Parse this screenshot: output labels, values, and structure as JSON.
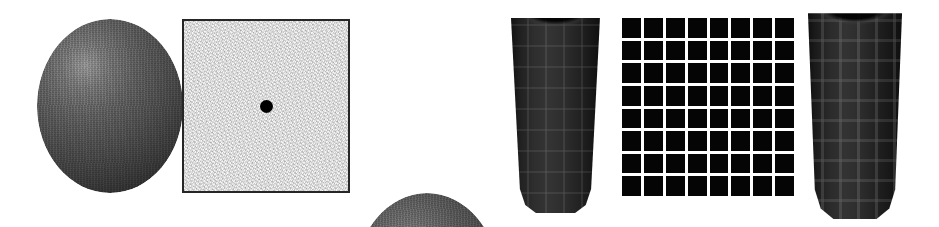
{
  "figure": {
    "width": 939,
    "height": 227,
    "background_color": "#ffffff",
    "panel_count": 6,
    "panel_order": [
      "textured-sphere-left",
      "noise-square-with-fixation-dot",
      "textured-sphere-right",
      "textured-cylinder-left",
      "checkerboard-grid",
      "textured-cylinder-right"
    ]
  },
  "panels": {
    "sphere_one": {
      "name": "textured-sphere-left",
      "shape": "sphere",
      "x": 37,
      "y": 19,
      "width": 146,
      "height": 174,
      "highlight_position": "upper-left",
      "base_color": "#515151",
      "highlight_color": "#9a9a9a",
      "shadow_color": "#242424",
      "surface": "grainy"
    },
    "noise_square": {
      "name": "noise-square-with-fixation-dot",
      "shape": "square",
      "x": 182,
      "y": 19,
      "width": 168,
      "height": 174,
      "fill_color": "#f6f6f6",
      "border_color": "#262626",
      "border_width": 2,
      "surface": "white-noise",
      "fixation_dot": {
        "name": "fixation-dot",
        "shape": "circle",
        "diameter": 13,
        "color": "#000000",
        "position": "center"
      }
    },
    "sphere_two": {
      "name": "textured-sphere-right",
      "shape": "sphere",
      "x": 355,
      "y": 19,
      "width": 144,
      "height": 175,
      "highlight_position": "upper-center-left",
      "base_color": "#4e4e4e",
      "highlight_color": "#8e8e8e",
      "shadow_color": "#222222",
      "surface": "grainy"
    },
    "cylinder_one": {
      "name": "textured-cylinder-left",
      "shape": "tapered-cylinder",
      "x": 511,
      "y": 12,
      "width": 89,
      "height": 201,
      "base_color": "#2e2e2e",
      "texture_color": "#696969",
      "rim_color": "#000000",
      "surface": "brick-checker-wrapped",
      "rim": "open-top-ellipse"
    },
    "checker_grid": {
      "name": "checkerboard-grid",
      "shape": "grid",
      "x": 622,
      "y": 18,
      "width": 172,
      "height": 178,
      "rows": 8,
      "columns": 8,
      "cell_count": 64,
      "cell_color": "#050505",
      "gridline_color": "#ffffff",
      "gridline_width": 3
    },
    "cylinder_two": {
      "name": "textured-cylinder-right",
      "shape": "tapered-cylinder",
      "x": 806,
      "y": 9,
      "width": 98,
      "height": 210,
      "base_color": "#2a2a2a",
      "texture_color": "#707070",
      "rim_color": "#000000",
      "surface": "grid-checker-wrapped",
      "rim": "open-top-ellipse"
    }
  }
}
